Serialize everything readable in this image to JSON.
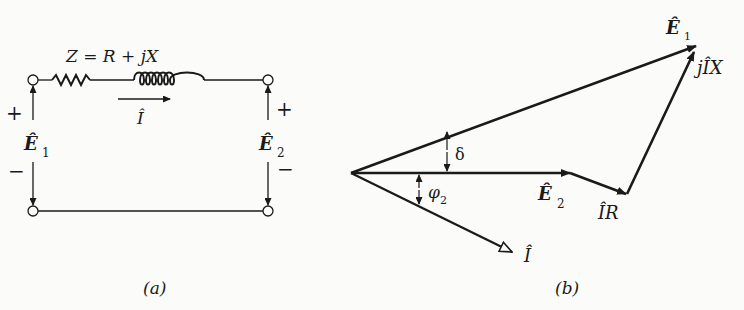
{
  "circuit": {
    "impedance_label": "Z = R + jX",
    "current_label": "Î",
    "sending_voltage": {
      "symbol": "Ê",
      "subscript": "1",
      "plus": "+",
      "minus": "−"
    },
    "receiving_voltage": {
      "symbol": "Ê",
      "subscript": "2",
      "plus": "+",
      "minus": "−"
    },
    "caption": "(a)"
  },
  "phasor": {
    "e1": {
      "symbol": "Ê",
      "subscript": "1"
    },
    "e2": {
      "symbol": "Ê",
      "subscript": "2"
    },
    "ir": "ÎR",
    "jix": "jÎX",
    "current": "Î",
    "delta": "δ",
    "phi": {
      "symbol": "φ",
      "subscript": "2"
    },
    "caption": "(b)"
  },
  "colors": {
    "ink": "#1a1a1a",
    "background": "#fbfbf9"
  }
}
